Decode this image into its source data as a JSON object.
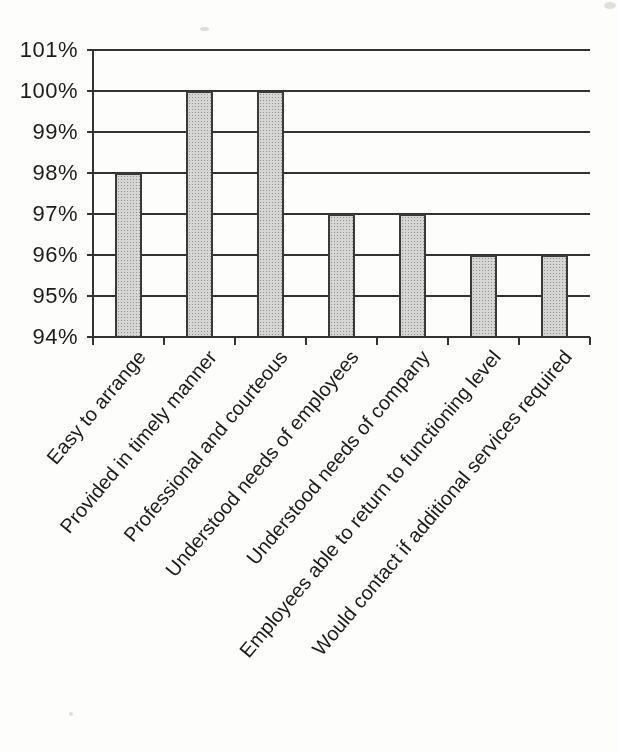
{
  "page": {
    "background": "#fdfdfc"
  },
  "chart_data": {
    "type": "bar",
    "title": "",
    "xlabel": "",
    "ylabel": "",
    "categories": [
      "Easy to arrange",
      "Provided in timely manner",
      "Professional and courteous",
      "Understood needs of employees",
      "Understood needs of company",
      "Employees able to return to functioning level",
      "Would contact if additional services required"
    ],
    "values": [
      98,
      100,
      100,
      97,
      97,
      96,
      96
    ],
    "unit": "%",
    "ylim": [
      94,
      101
    ],
    "ytick_step": 1,
    "ytick_labels": [
      "94%",
      "95%",
      "96%",
      "97%",
      "98%",
      "99%",
      "100%",
      "101%"
    ],
    "grid": "horizontal",
    "legend": "none",
    "x_label_rotation_deg": -50,
    "colors": {
      "bar_fill": "#d6d6d4",
      "bar_dot": "#8f8f8d",
      "bar_border": "#3a3a38",
      "line": "#333331",
      "text": "#1c1c1a"
    }
  }
}
